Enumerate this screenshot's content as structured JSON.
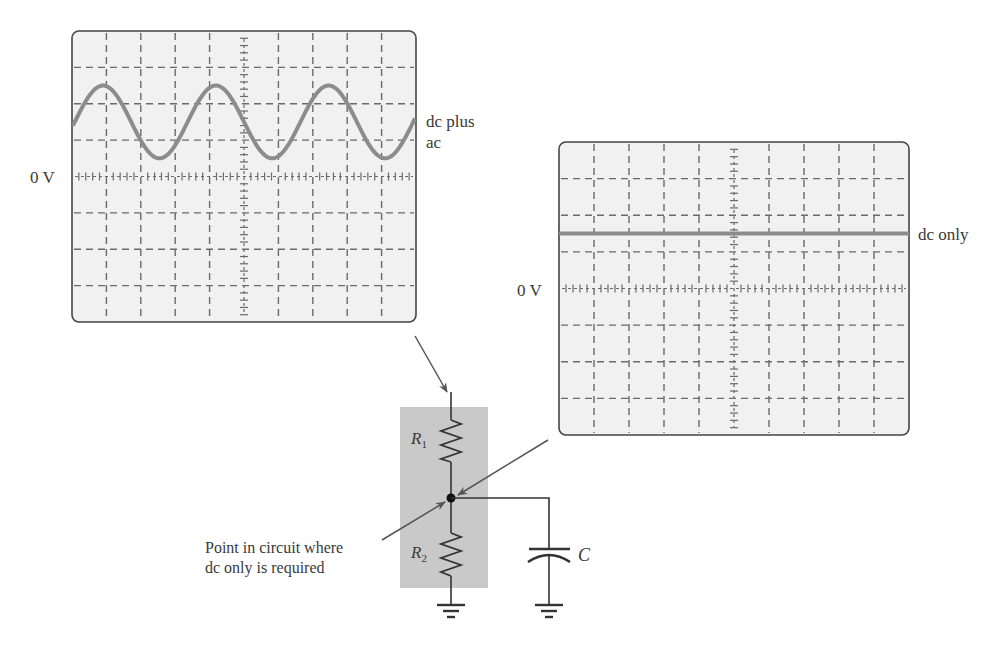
{
  "scope_left": {
    "label_zero": "0 V",
    "trace_label_line1": "dc plus",
    "trace_label_line2": "ac",
    "grid": {
      "cols": 10,
      "rows": 8
    },
    "trace": {
      "type": "sine",
      "offset_div": 1.5,
      "amplitude_div": 1.0,
      "period_div": 3.28
    }
  },
  "scope_right": {
    "label_zero": "0 V",
    "trace_label": "dc only",
    "grid": {
      "cols": 10,
      "rows": 8
    },
    "trace": {
      "type": "dc",
      "offset_div": 1.5
    }
  },
  "circuit": {
    "r1_label": "R",
    "r1_sub": "1",
    "r2_label": "R",
    "r2_sub": "2",
    "c_label": "C",
    "annotation_line1": "Point in circuit where",
    "annotation_line2": "dc only is required"
  },
  "colors": {
    "screen_bg": "#f1f1f1",
    "grid": "#6a6a6a",
    "trace": "#8c8c8c",
    "shade": "#c9c9c9",
    "wire": "#333333"
  }
}
